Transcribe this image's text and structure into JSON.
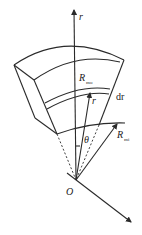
{
  "diagram": {
    "colors": {
      "line": "#2a2a2a",
      "text": "#222222",
      "background": "#ffffff"
    },
    "labels": {
      "r_axis": "r",
      "r_axis_sub": "",
      "outer_radius_main": "R",
      "outer_radius_sub": "mo",
      "layer_thickness": "dr",
      "ray_r": "r",
      "angle": "θ",
      "inner_radius_main": "R",
      "inner_radius_sub": "mi",
      "origin": "O"
    }
  }
}
